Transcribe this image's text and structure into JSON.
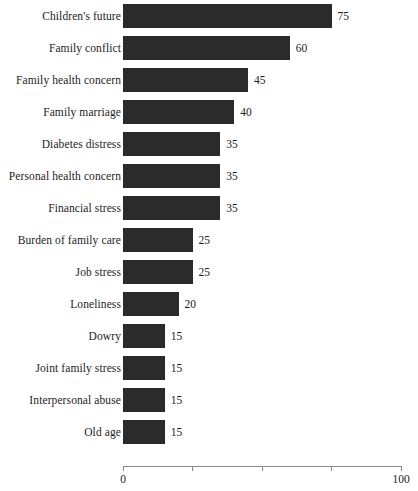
{
  "chart_data": {
    "type": "bar",
    "orientation": "horizontal",
    "title": "",
    "subtitle": "",
    "xlabel": "",
    "ylabel": "",
    "xlim": [
      0,
      100
    ],
    "grid": false,
    "legend": null,
    "show_value_labels": true,
    "bar_color": "#2b2b2b",
    "axis_color": "#8a8a8a",
    "background_color": "#ffffff",
    "tick_values": [
      0,
      25,
      50,
      75,
      100
    ],
    "tick_labels": [
      "0",
      "",
      "",
      "",
      "100"
    ],
    "categories": [
      "Children's future",
      "Family conflict",
      "Family health concern",
      "Family marriage",
      "Diabetes distress",
      "Personal health concern",
      "Financial stress",
      "Burden of family care",
      "Job stress",
      "Loneliness",
      "Dowry",
      "Joint family stress",
      "Interpersonal abuse",
      "Old age"
    ],
    "values": [
      75,
      60,
      45,
      40,
      35,
      35,
      35,
      25,
      25,
      20,
      15,
      15,
      15,
      15
    ]
  }
}
